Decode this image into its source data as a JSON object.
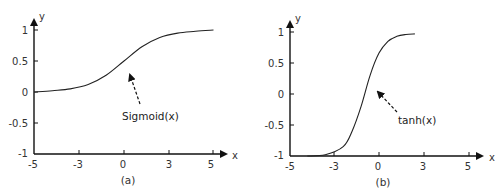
{
  "chart_data": [
    {
      "type": "line",
      "panel": "(a)",
      "title": "",
      "caption": "(a)",
      "xlabel": "x",
      "ylabel": "y",
      "xlim": [
        -5,
        5
      ],
      "ylim": [
        -1,
        1
      ],
      "x_ticks": [
        "-5",
        "-3",
        "0",
        "3",
        "5"
      ],
      "y_ticks": [
        "1",
        "0.5",
        "0",
        "-0.5",
        "-1"
      ],
      "grid": false,
      "annotation": "Sigmoid(x)",
      "series": [
        {
          "name": "Sigmoid(x)",
          "x": [
            -5,
            -4,
            -3,
            -2,
            -1,
            0,
            1,
            2,
            3,
            4,
            5
          ],
          "y": [
            0.0,
            0.02,
            0.05,
            0.12,
            0.27,
            0.5,
            0.73,
            0.88,
            0.95,
            0.98,
            1.0
          ]
        }
      ]
    },
    {
      "type": "line",
      "panel": "(b)",
      "title": "",
      "caption": "(b)",
      "xlabel": "x",
      "ylabel": "y",
      "xlim": [
        -5,
        5
      ],
      "ylim": [
        -1,
        1
      ],
      "x_ticks": [
        "-5",
        "-3",
        "0",
        "3",
        "5"
      ],
      "y_ticks": [
        "1",
        "0.5",
        "0",
        "-0.5",
        "-1"
      ],
      "grid": false,
      "annotation": "tanh(x)",
      "series": [
        {
          "name": "tanh(x)",
          "x": [
            -4,
            -3,
            -2,
            -1.5,
            -1,
            -0.5,
            0,
            0.5,
            1,
            1.5,
            2
          ],
          "y": [
            -1.0,
            -0.98,
            -0.85,
            -0.6,
            -0.2,
            0.3,
            0.66,
            0.85,
            0.93,
            0.96,
            0.97
          ]
        }
      ]
    }
  ]
}
